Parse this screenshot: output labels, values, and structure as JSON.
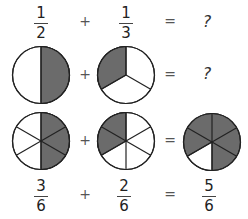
{
  "colors": {
    "shaded": "#6b6b6b",
    "empty": "#ffffff",
    "stroke": "#222222"
  },
  "row1": {
    "left": {
      "numerator": "1",
      "denominator": "2"
    },
    "plus": "+",
    "right": {
      "numerator": "1",
      "denominator": "3"
    },
    "equals": "=",
    "result": "?"
  },
  "row2": {
    "plus": "+",
    "equals": "=",
    "result": "?",
    "circles": [
      {
        "parts": 2,
        "shaded": 1,
        "label": "one half"
      },
      {
        "parts": 3,
        "shaded": 1,
        "label": "one third"
      }
    ]
  },
  "row3": {
    "plus": "+",
    "equals": "=",
    "circles": [
      {
        "parts": 6,
        "shaded": 3,
        "label": "three sixths"
      },
      {
        "parts": 6,
        "shaded": 2,
        "label": "two sixths"
      },
      {
        "parts": 6,
        "shaded": 5,
        "label": "five sixths"
      }
    ]
  },
  "row4": {
    "left": {
      "numerator": "3",
      "denominator": "6"
    },
    "plus": "+",
    "right": {
      "numerator": "2",
      "denominator": "6"
    },
    "equals": "=",
    "result": {
      "numerator": "5",
      "denominator": "6"
    }
  }
}
